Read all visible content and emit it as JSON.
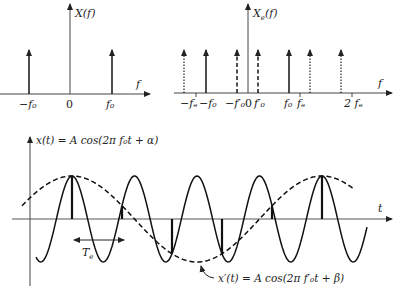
{
  "colors": {
    "ink": "#222222",
    "axis": "#555555",
    "background": "#ffffff"
  },
  "spectrum_left": {
    "title": "X(f)",
    "axis_label": "f",
    "ticks": [
      "−f₀",
      "0",
      "f₀"
    ],
    "lines": [
      {
        "label": "−f₀",
        "style": "solid"
      },
      {
        "label": "f₀",
        "style": "solid"
      }
    ]
  },
  "spectrum_right": {
    "title_main": "X",
    "title_sub": "e",
    "title_tail": "(f)",
    "axis_label": "f",
    "ticks": [
      "−fₑ",
      "−f₀",
      "−f′₀",
      "0",
      "f′₀",
      "f₀",
      "fₑ",
      "2 fₑ"
    ],
    "lines": [
      {
        "label": "−fₑ−f₀′ image",
        "style": "dotted"
      },
      {
        "label": "−f₀",
        "style": "solid"
      },
      {
        "label": "−f′₀",
        "style": "dashed"
      },
      {
        "label": "f′₀",
        "style": "dashed"
      },
      {
        "label": "f₀",
        "style": "solid"
      },
      {
        "label": "fₑ+f′₀ image",
        "style": "dotted"
      },
      {
        "label": "2fₑ−f₀ image",
        "style": "dotted"
      }
    ]
  },
  "time_plot": {
    "axis_label": "t",
    "signal_label": "x(t) = A cos(2π f₀t + α)",
    "alias_label": "x′(t) = A cos(2π f′₀t + β)",
    "period_label": "T",
    "period_sub": "e",
    "sample_count": 6
  }
}
